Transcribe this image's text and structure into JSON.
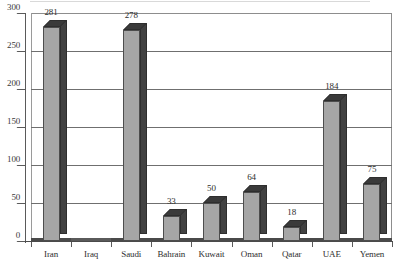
{
  "chart_data": {
    "type": "bar",
    "title": "",
    "subtitle": "",
    "xlabel": "",
    "ylabel": "",
    "categories": [
      "Iran",
      "Iraq",
      "Saudi",
      "Bahrain",
      "Kuwait",
      "Oman",
      "Qatar",
      "UAE",
      "Yemen"
    ],
    "values": [
      281,
      null,
      278,
      33,
      50,
      64,
      18,
      184,
      75
    ],
    "value_labels": [
      "281",
      "",
      "278",
      "33",
      "50",
      "64",
      "18",
      "184",
      "75"
    ],
    "ylim": [
      0,
      300
    ],
    "ytick_labels": [
      "0",
      "50",
      "100",
      "150",
      "200",
      "250",
      "300"
    ],
    "ytick_values": [
      0,
      50,
      100,
      150,
      200,
      250,
      300
    ],
    "grid": true,
    "grid_axis": "y",
    "legend": null,
    "legend_position": "none",
    "style": "3d-column",
    "colors": {
      "bar_front": "#a6a6a6",
      "bar_side": "#414141",
      "bar_top": "#3a3a3a",
      "bar_outline": "#4d4d4d",
      "gridline": "#6f6f6f",
      "axis": "#5a5a5a",
      "text": "#2e2e2e",
      "background": "#ffffff"
    }
  }
}
